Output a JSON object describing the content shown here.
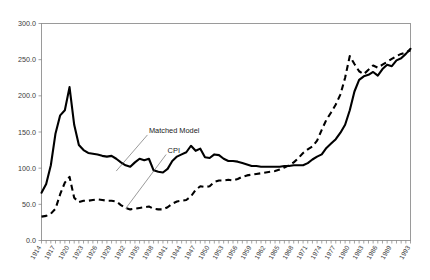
{
  "chart_data": {
    "type": "line",
    "title": "",
    "subtitle": "",
    "xlabel": "",
    "ylabel": "",
    "xlim": [
      1914,
      1993
    ],
    "ylim": [
      0.0,
      300.0
    ],
    "grid": false,
    "legend_position": "inline-annotations",
    "ytick_labels": [
      "0.0",
      "50.0",
      "100.0",
      "150.0",
      "200.0",
      "250.0",
      "300.0"
    ],
    "ytick_values": [
      0,
      50,
      100,
      150,
      200,
      250,
      300
    ],
    "xtick_labels": [
      "1914",
      "1917",
      "1920",
      "1923",
      "1926",
      "1929",
      "1932",
      "1935",
      "1938",
      "1941",
      "1944",
      "1947",
      "1950",
      "1953",
      "1956",
      "1959",
      "1962",
      "1965",
      "1968",
      "1971",
      "1974",
      "1977",
      "1980",
      "1983",
      "1986",
      "1989",
      "1993"
    ],
    "xtick_values": [
      1914,
      1917,
      1920,
      1923,
      1926,
      1929,
      1932,
      1935,
      1938,
      1941,
      1944,
      1947,
      1950,
      1953,
      1956,
      1959,
      1962,
      1965,
      1968,
      1971,
      1974,
      1977,
      1980,
      1983,
      1986,
      1989,
      1993
    ],
    "annotations": [
      {
        "text": "Matched Model",
        "x": 1937,
        "y": 148,
        "target_x": 1930,
        "target_y": 96
      },
      {
        "text": "CPI",
        "x": 1941,
        "y": 121,
        "target_x": 1932,
        "target_y": 44
      }
    ],
    "x": [
      1914,
      1915,
      1916,
      1917,
      1918,
      1919,
      1920,
      1921,
      1922,
      1923,
      1924,
      1925,
      1926,
      1927,
      1928,
      1929,
      1930,
      1931,
      1932,
      1933,
      1934,
      1935,
      1936,
      1937,
      1938,
      1939,
      1940,
      1941,
      1942,
      1943,
      1944,
      1945,
      1946,
      1947,
      1948,
      1949,
      1950,
      1951,
      1952,
      1953,
      1954,
      1955,
      1956,
      1957,
      1958,
      1959,
      1960,
      1961,
      1962,
      1963,
      1964,
      1965,
      1966,
      1967,
      1968,
      1969,
      1970,
      1971,
      1972,
      1973,
      1974,
      1975,
      1976,
      1977,
      1978,
      1979,
      1980,
      1981,
      1982,
      1983,
      1984,
      1985,
      1986,
      1987,
      1988,
      1989,
      1990,
      1991,
      1992,
      1993
    ],
    "series": [
      {
        "name": "Matched Model",
        "style": "solid",
        "color": "#000000",
        "values": [
          66,
          78,
          104,
          148,
          173,
          180,
          212,
          160,
          132,
          125,
          121,
          120,
          119,
          117,
          116,
          117,
          113,
          108,
          104,
          102,
          108,
          113,
          111,
          113,
          97,
          95,
          94,
          99,
          110,
          116,
          119,
          122,
          131,
          124,
          127,
          115,
          114,
          119,
          118,
          113,
          110,
          110,
          109,
          107,
          105,
          103,
          103,
          102,
          102,
          102,
          102,
          102,
          103,
          103,
          104,
          104,
          104,
          107,
          112,
          116,
          119,
          128,
          134,
          140,
          149,
          160,
          180,
          206,
          222,
          227,
          229,
          233,
          228,
          237,
          243,
          241,
          249,
          252,
          258,
          265
        ]
      },
      {
        "name": "CPI",
        "style": "dashed",
        "color": "#000000",
        "values": [
          33,
          34,
          37,
          44,
          64,
          80,
          88,
          59,
          53,
          55,
          55,
          56,
          57,
          56,
          55,
          55,
          54,
          49,
          45,
          43,
          44,
          45,
          46,
          47,
          44,
          43,
          43,
          46,
          51,
          54,
          55,
          56,
          61,
          70,
          75,
          74,
          75,
          81,
          83,
          83,
          84,
          83,
          85,
          88,
          90,
          91,
          92,
          93,
          94,
          95,
          96,
          98,
          101,
          104,
          108,
          114,
          121,
          126,
          130,
          138,
          153,
          167,
          177,
          188,
          202,
          225,
          255,
          244,
          234,
          230,
          236,
          242,
          239,
          243,
          247,
          251,
          255,
          258,
          260,
          263
        ]
      }
    ]
  }
}
